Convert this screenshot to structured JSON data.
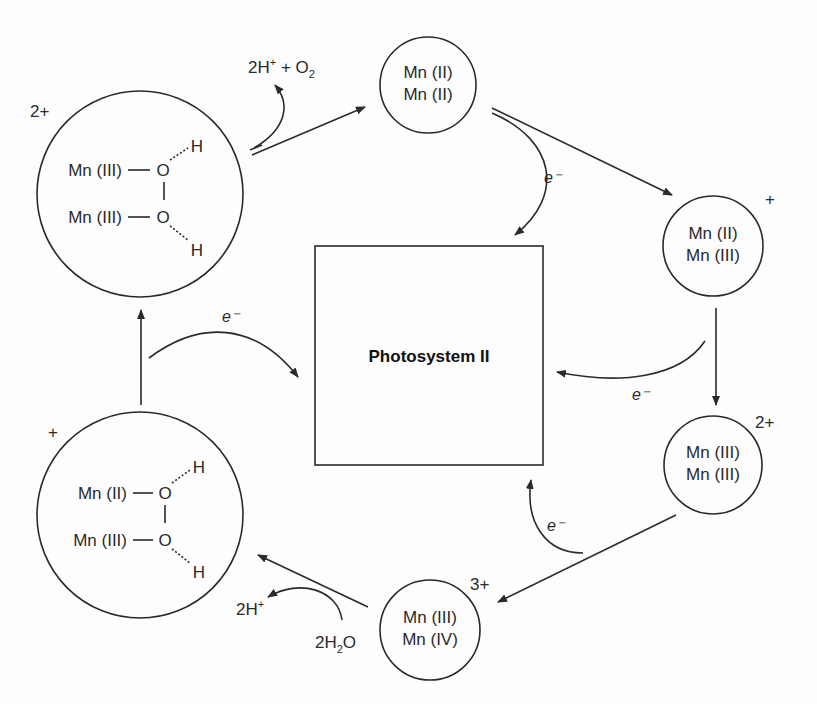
{
  "center_box": {
    "label": "Photosystem II"
  },
  "states": [
    {
      "id": "s0",
      "charge": "2+",
      "lines": [
        "Mn (III)",
        "Mn (III)"
      ],
      "ligand": "O–O bridged with H",
      "top_mn": "Mn (III)",
      "bottom_mn": "Mn (III)",
      "o": "O",
      "h": "H"
    },
    {
      "id": "s1",
      "charge": "",
      "lines": [
        "Mn (II)",
        "Mn (II)"
      ]
    },
    {
      "id": "s2",
      "charge": "+",
      "lines": [
        "Mn (II)",
        "Mn (III)"
      ]
    },
    {
      "id": "s3",
      "charge": "2+",
      "lines": [
        "Mn (III)",
        "Mn (III)"
      ]
    },
    {
      "id": "s4",
      "charge": "3+",
      "lines": [
        "Mn (III)",
        "Mn (IV)"
      ]
    },
    {
      "id": "s5",
      "charge": "+",
      "top_mn": "Mn (II)",
      "bottom_mn": "Mn (III)",
      "o": "O",
      "h": "H"
    }
  ],
  "transfers": {
    "electron": "e⁻",
    "release_o2": {
      "main": "2H",
      "sup": "+",
      "plus": " + O",
      "sub": "2"
    },
    "release_h": {
      "main": "2H",
      "sup": "+"
    },
    "water_in": {
      "pre": "2H",
      "sub": "2",
      "post": "O"
    }
  }
}
